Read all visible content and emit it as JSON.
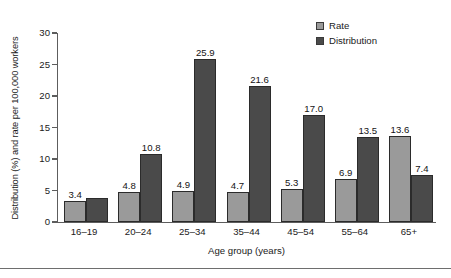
{
  "chart_data": {
    "type": "bar",
    "title": "",
    "xlabel": "Age group (years)",
    "ylabel": "Distribution (%) and rate per 100,000 workers",
    "categories": [
      "16–19",
      "20–24",
      "25–34",
      "35–44",
      "45–54",
      "55–64",
      "65+"
    ],
    "series": [
      {
        "name": "Rate",
        "color": "#9a9a9a",
        "values": [
          3.4,
          4.8,
          4.9,
          4.7,
          5.3,
          6.9,
          13.6
        ],
        "labels": [
          "3.4",
          "4.8",
          "4.9",
          "4.7",
          "5.3",
          "6.9",
          "13.6"
        ]
      },
      {
        "name": "Distribution",
        "color": "#4a4a4a",
        "values": [
          3.8,
          10.8,
          25.9,
          21.6,
          17.0,
          13.5,
          7.4
        ],
        "labels": [
          "",
          "10.8",
          "25.9",
          "21.6",
          "17.0",
          "13.5",
          "7.4"
        ]
      }
    ],
    "ylim": [
      0,
      30
    ],
    "yticks": [
      0,
      5,
      10,
      15,
      20,
      25,
      30
    ],
    "ytick_labels": [
      "0",
      "5",
      "10",
      "15",
      "20",
      "25",
      "30"
    ],
    "grid": false,
    "legend_position": "top-right"
  },
  "legend": {
    "items": [
      {
        "label": "Rate",
        "color": "#9a9a9a"
      },
      {
        "label": "Distribution",
        "color": "#4a4a4a"
      }
    ]
  },
  "axes": {
    "y_title": "Distribution (%) and rate per 100,000 workers",
    "x_title": "Age group (years)",
    "y_ticks": [
      "0",
      "5",
      "10",
      "15",
      "20",
      "25",
      "30"
    ],
    "x_ticks": [
      "16–19",
      "20–24",
      "25–34",
      "35–44",
      "45–54",
      "55–64",
      "65+"
    ]
  },
  "values": {
    "rate": [
      "3.4",
      "4.8",
      "4.9",
      "4.7",
      "5.3",
      "6.9",
      "13.6"
    ],
    "distribution": [
      "",
      "10.8",
      "25.9",
      "21.6",
      "17.0",
      "13.5",
      "7.4"
    ]
  }
}
